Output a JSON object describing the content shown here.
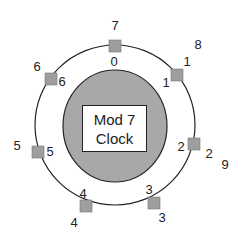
{
  "diagram": {
    "title_line1": "Mod 7",
    "title_line2": "Clock",
    "colors": {
      "inner_disc": "#a8a8a8",
      "square": "#9e9e9e",
      "line": "#222222",
      "box": "#ffffff"
    },
    "positions": [
      {
        "inner": "0",
        "outer": "7"
      },
      {
        "inner": "1",
        "outer": "1",
        "extra": "8"
      },
      {
        "inner": "2",
        "outer": "2",
        "extra": "9"
      },
      {
        "inner": "3",
        "outer": "3"
      },
      {
        "inner": "4",
        "outer": "4"
      },
      {
        "inner": "5",
        "outer": "5"
      },
      {
        "inner": "6",
        "outer": "6"
      }
    ]
  }
}
